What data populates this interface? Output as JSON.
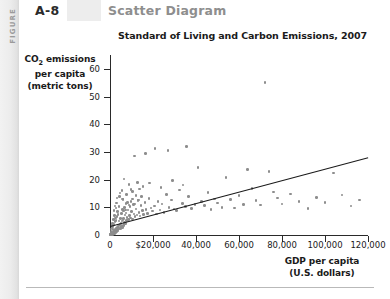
{
  "header": {
    "figure_spine_label": "FIGURE",
    "figure_number": "A-8",
    "figure_title": "Scatter Diagram"
  },
  "chart_data": {
    "type": "scatter",
    "title": "Standard of Living and Carbon Emissions, 2007",
    "xlabel": "GDP per capita (U.S. dollars)",
    "xlabel_line1": "GDP per capita",
    "xlabel_line2": "(U.S. dollars)",
    "ylabel": "CO2 emissions per capita (metric tons)",
    "ylabel_line1_pre": "CO",
    "ylabel_line1_sub": "2",
    "ylabel_line1_post": " emissions",
    "ylabel_line2": "per capita",
    "ylabel_line3": "(metric tons)",
    "xlim": [
      0,
      120000
    ],
    "ylim": [
      0,
      65
    ],
    "grid": false,
    "legend": "none",
    "marker_color": "#8d8d8d",
    "trendline_color": "#1a1a1a",
    "xticks": [
      0,
      20000,
      40000,
      60000,
      80000,
      100000,
      120000
    ],
    "xticklabels": [
      "0",
      "$20,000",
      "40,000",
      "60,000",
      "80,000",
      "100,000",
      "120,000"
    ],
    "yticks": [
      0,
      10,
      20,
      30,
      40,
      50,
      60
    ],
    "yticklabels": [
      "0",
      "10",
      "20",
      "30",
      "40",
      "50",
      "60"
    ],
    "trendline": {
      "x0": 0,
      "y0": 3.2,
      "x1": 120000,
      "y1": 28.0
    },
    "points": [
      [
        500,
        0.2
      ],
      [
        600,
        0.1
      ],
      [
        700,
        0.3
      ],
      [
        800,
        0.2
      ],
      [
        900,
        0.4
      ],
      [
        1000,
        0.3
      ],
      [
        1100,
        0.5
      ],
      [
        1200,
        0.2
      ],
      [
        1300,
        0.6
      ],
      [
        1400,
        0.4
      ],
      [
        1500,
        0.8
      ],
      [
        1600,
        0.3
      ],
      [
        1700,
        1.0
      ],
      [
        1800,
        0.5
      ],
      [
        1900,
        0.9
      ],
      [
        2000,
        1.2
      ],
      [
        2100,
        0.6
      ],
      [
        2200,
        1.4
      ],
      [
        2300,
        0.8
      ],
      [
        2400,
        1.6
      ],
      [
        2500,
        1.0
      ],
      [
        2600,
        2.0
      ],
      [
        2700,
        1.1
      ],
      [
        2800,
        2.4
      ],
      [
        2900,
        1.3
      ],
      [
        3000,
        1.8
      ],
      [
        3200,
        2.2
      ],
      [
        3400,
        1.5
      ],
      [
        3600,
        2.8
      ],
      [
        3800,
        1.9
      ],
      [
        4000,
        3.2
      ],
      [
        4200,
        2.1
      ],
      [
        4400,
        3.6
      ],
      [
        4600,
        2.5
      ],
      [
        4800,
        4.0
      ],
      [
        5000,
        2.3
      ],
      [
        5200,
        4.4
      ],
      [
        5400,
        3.0
      ],
      [
        5600,
        5.0
      ],
      [
        5800,
        2.7
      ],
      [
        6000,
        5.4
      ],
      [
        6200,
        3.4
      ],
      [
        6400,
        6.0
      ],
      [
        6600,
        3.8
      ],
      [
        6800,
        4.6
      ],
      [
        7000,
        7.2
      ],
      [
        7200,
        4.2
      ],
      [
        7500,
        8.0
      ],
      [
        7800,
        5.2
      ],
      [
        8000,
        6.4
      ],
      [
        8300,
        9.0
      ],
      [
        8600,
        5.6
      ],
      [
        9000,
        7.0
      ],
      [
        9300,
        10.2
      ],
      [
        9600,
        6.2
      ],
      [
        10000,
        8.4
      ],
      [
        10400,
        5.8
      ],
      [
        10800,
        11.0
      ],
      [
        11200,
        7.6
      ],
      [
        11600,
        6.6
      ],
      [
        12000,
        9.4
      ],
      [
        12500,
        7.2
      ],
      [
        13000,
        12.4
      ],
      [
        13500,
        8.2
      ],
      [
        14000,
        6.8
      ],
      [
        14500,
        10.6
      ],
      [
        15000,
        8.8
      ],
      [
        15600,
        7.4
      ],
      [
        16200,
        11.8
      ],
      [
        16800,
        9.2
      ],
      [
        17500,
        7.8
      ],
      [
        18200,
        13.2
      ],
      [
        19000,
        9.8
      ],
      [
        19800,
        8.6
      ],
      [
        20600,
        10.4
      ],
      [
        21500,
        7.6
      ],
      [
        22400,
        12.0
      ],
      [
        23300,
        9.0
      ],
      [
        24200,
        11.2
      ],
      [
        25200,
        8.2
      ],
      [
        26300,
        14.6
      ],
      [
        27400,
        10.0
      ],
      [
        28600,
        12.6
      ],
      [
        29800,
        9.4
      ],
      [
        31000,
        8.8
      ],
      [
        32400,
        16.2
      ],
      [
        33800,
        11.4
      ],
      [
        35200,
        10.2
      ],
      [
        36600,
        13.8
      ],
      [
        38000,
        9.6
      ],
      [
        39500,
        11.0
      ],
      [
        41000,
        24.4
      ],
      [
        42500,
        12.2
      ],
      [
        44000,
        10.6
      ],
      [
        45500,
        15.4
      ],
      [
        47000,
        9.2
      ],
      [
        48500,
        13.0
      ],
      [
        50000,
        11.6
      ],
      [
        52000,
        10.0
      ],
      [
        54000,
        20.8
      ],
      [
        56000,
        12.8
      ],
      [
        58000,
        9.8
      ],
      [
        60000,
        14.2
      ],
      [
        62000,
        11.0
      ],
      [
        64000,
        23.6
      ],
      [
        66000,
        16.8
      ],
      [
        68000,
        12.4
      ],
      [
        70000,
        10.8
      ],
      [
        72000,
        55.0
      ],
      [
        74000,
        23.0
      ],
      [
        76000,
        15.6
      ],
      [
        78000,
        13.4
      ],
      [
        80000,
        11.2
      ],
      [
        84000,
        14.8
      ],
      [
        88000,
        12.0
      ],
      [
        92000,
        9.6
      ],
      [
        96000,
        13.6
      ],
      [
        100000,
        11.8
      ],
      [
        104000,
        22.4
      ],
      [
        108000,
        14.4
      ],
      [
        112000,
        10.4
      ],
      [
        116000,
        12.6
      ],
      [
        6500,
        20.2
      ],
      [
        9800,
        16.4
      ],
      [
        12800,
        19.0
      ],
      [
        15400,
        17.6
      ],
      [
        4500,
        14.0
      ],
      [
        3100,
        11.6
      ],
      [
        5600,
        16.0
      ],
      [
        8800,
        18.2
      ],
      [
        21000,
        31.2
      ],
      [
        27000,
        30.6
      ],
      [
        35500,
        32.0
      ],
      [
        16500,
        29.4
      ],
      [
        11500,
        28.6
      ],
      [
        2800,
        9.8
      ],
      [
        3500,
        8.4
      ],
      [
        4100,
        10.2
      ],
      [
        6100,
        12.8
      ],
      [
        7400,
        11.4
      ],
      [
        1600,
        5.6
      ],
      [
        2100,
        7.0
      ],
      [
        2600,
        6.2
      ],
      [
        1300,
        4.2
      ],
      [
        900,
        3.4
      ],
      [
        1800,
        8.8
      ],
      [
        2300,
        10.4
      ],
      [
        3300,
        13.4
      ],
      [
        4700,
        15.2
      ],
      [
        5900,
        13.0
      ],
      [
        7700,
        14.6
      ],
      [
        10600,
        15.8
      ],
      [
        13800,
        16.6
      ],
      [
        18500,
        18.8
      ],
      [
        23800,
        17.2
      ],
      [
        29000,
        19.6
      ],
      [
        34000,
        18.0
      ],
      [
        400,
        1.4
      ],
      [
        550,
        2.2
      ],
      [
        750,
        1.0
      ],
      [
        950,
        2.6
      ],
      [
        1150,
        3.0
      ],
      [
        1450,
        2.0
      ],
      [
        1750,
        3.8
      ],
      [
        2250,
        4.8
      ],
      [
        2750,
        5.2
      ],
      [
        3250,
        6.6
      ],
      [
        3750,
        7.4
      ],
      [
        4250,
        5.0
      ],
      [
        4750,
        6.0
      ],
      [
        5250,
        7.8
      ],
      [
        5750,
        9.2
      ],
      [
        6250,
        8.6
      ],
      [
        6750,
        10.0
      ],
      [
        7250,
        9.0
      ],
      [
        8100,
        11.8
      ],
      [
        8900,
        10.8
      ],
      [
        9700,
        12.2
      ],
      [
        10500,
        13.0
      ],
      [
        11300,
        11.2
      ],
      [
        12100,
        14.2
      ],
      [
        13300,
        12.6
      ],
      [
        14700,
        13.8
      ],
      [
        200,
        0.1
      ],
      [
        300,
        0.2
      ],
      [
        350,
        0.15
      ],
      [
        450,
        0.25
      ],
      [
        650,
        0.35
      ],
      [
        850,
        0.45
      ]
    ],
    "n_points": 186
  }
}
